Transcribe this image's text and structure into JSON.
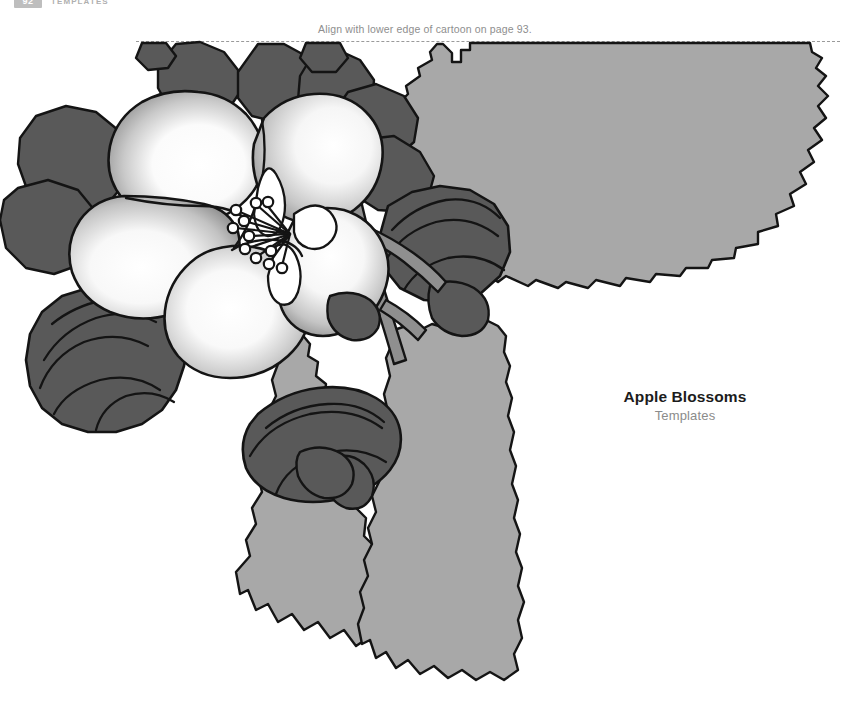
{
  "page": {
    "width": 850,
    "height": 708,
    "background_color": "#ffffff"
  },
  "running_header": {
    "page_number": "92",
    "label": "TEMPLATES",
    "badge_color": "#8a8a8a"
  },
  "align_note": {
    "text": "Align with lower edge of cartoon on page 93."
  },
  "trim_guide": {
    "style": "dashed",
    "color": "#9a9a9a"
  },
  "caption": {
    "title": "Apple Blossoms",
    "subtitle": "Templates",
    "title_color": "#1c1c1c",
    "subtitle_color": "#8b8b8b"
  },
  "artwork": {
    "name": "apple-blossom-template-illustration",
    "description": "Grayscale line illustration of an apple blossom with open flower, buds, stems and serrated leaves",
    "palette": {
      "outline": "#141414",
      "leaf_light": "#a8a8a8",
      "leaf_dark": "#595959",
      "stem": "#8f8f8f",
      "petal_light": "#ffffff",
      "petal_shadow": "#9c9c9c",
      "paper": "#ffffff"
    },
    "elements": [
      {
        "name": "large-upper-right-leaf",
        "fill": "#a8a8a8",
        "edge": "serrated"
      },
      {
        "name": "lower-left-leaf",
        "fill": "#a8a8a8",
        "edge": "serrated"
      },
      {
        "name": "lower-right-leaf",
        "fill": "#a8a8a8",
        "edge": "serrated"
      },
      {
        "name": "open-blossom",
        "fill": "gradient-white-to-gray",
        "petal_count": 5
      },
      {
        "name": "blossom-stamens",
        "count": 11
      },
      {
        "name": "left-bud",
        "fill": "#595959"
      },
      {
        "name": "upper-left-bud",
        "fill": "#595959"
      },
      {
        "name": "right-bud",
        "fill": "#595959"
      },
      {
        "name": "lower-center-bud",
        "fill": "#595959"
      },
      {
        "name": "main-stem",
        "fill": "#8f8f8f"
      }
    ]
  }
}
